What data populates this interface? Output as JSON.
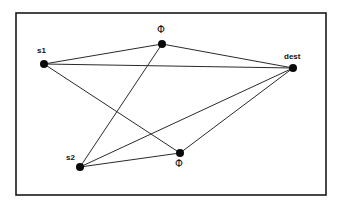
{
  "diagram": {
    "type": "network-graph",
    "frame": {
      "x": 16,
      "y": 13,
      "width": 310,
      "height": 182
    },
    "nodes": [
      {
        "id": "s1",
        "label": "s1",
        "x": 44,
        "y": 64,
        "label_x": 37,
        "label_y": 53
      },
      {
        "id": "phi_top",
        "label": "Φ",
        "x": 162,
        "y": 44,
        "label_x": 157,
        "label_y": 33
      },
      {
        "id": "dest",
        "label": "dest",
        "x": 293,
        "y": 68,
        "label_x": 284,
        "label_y": 59
      },
      {
        "id": "s2",
        "label": "s2",
        "x": 80,
        "y": 167,
        "label_x": 66,
        "label_y": 160
      },
      {
        "id": "phi_bottom",
        "label": "Φ",
        "x": 180,
        "y": 153,
        "label_x": 175,
        "label_y": 167
      }
    ],
    "edges": [
      {
        "from": "s1",
        "to": "phi_top"
      },
      {
        "from": "s1",
        "to": "dest"
      },
      {
        "from": "s1",
        "to": "phi_bottom"
      },
      {
        "from": "phi_top",
        "to": "dest"
      },
      {
        "from": "phi_top",
        "to": "s2"
      },
      {
        "from": "s2",
        "to": "dest"
      },
      {
        "from": "s2",
        "to": "phi_bottom"
      },
      {
        "from": "phi_bottom",
        "to": "dest"
      }
    ]
  }
}
